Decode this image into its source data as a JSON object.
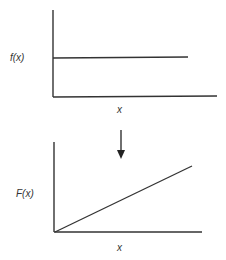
{
  "diagram": {
    "top_panel": {
      "ylabel": "f(x)",
      "xlabel": "x",
      "curve": "constant"
    },
    "bottom_panel": {
      "ylabel": "F(x)",
      "xlabel": "x",
      "curve": "linear-increasing"
    },
    "transition_arrow": "down-arrow-icon",
    "line_color": "#333333",
    "background": "#ffffff"
  }
}
